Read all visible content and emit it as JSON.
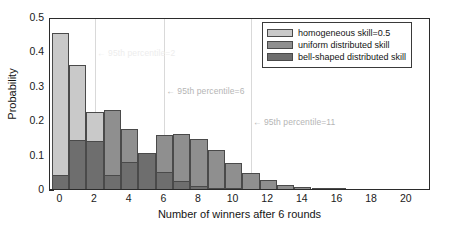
{
  "chart_data": {
    "type": "bar",
    "title": "",
    "subtitle": "",
    "xlabel": "Number of winners after 6 rounds",
    "ylabel": "Probability",
    "xlim": [
      -0.6,
      21.4
    ],
    "ylim": [
      0,
      0.5
    ],
    "xticks": [
      0,
      2,
      4,
      6,
      8,
      10,
      12,
      14,
      16,
      18,
      20
    ],
    "xtick_labels": [
      "0",
      "2",
      "4",
      "6",
      "8",
      "10",
      "12",
      "14",
      "16",
      "18",
      "20"
    ],
    "yticks": [
      0,
      0.1,
      0.2,
      0.3,
      0.4,
      0.5
    ],
    "ytick_labels": [
      "0",
      "0.1",
      "0.2",
      "0.3",
      "0.4",
      "0.5"
    ],
    "grid": false,
    "legend_position": "upper right",
    "bar_style": "overlaid",
    "categories": [
      0,
      1,
      2,
      3,
      4,
      5,
      6,
      7,
      8,
      9,
      10,
      11,
      12,
      13,
      14,
      15,
      16,
      17,
      18,
      19,
      20,
      21
    ],
    "series": [
      {
        "name": "homogeneous skill=0.5",
        "color": "#c9c9c9",
        "values": [
          0.453,
          0.36,
          0.225,
          0.0,
          0.0,
          0.0,
          0.0,
          0.0,
          0.0,
          0.0,
          0.0,
          0.0,
          0.0,
          0.0,
          0.0,
          0.0,
          0.0,
          0.0,
          0.0,
          0.0,
          0.0,
          0.0
        ]
      },
      {
        "name": "uniform distributed skill",
        "color": "#8f8f8f",
        "values": [
          0.042,
          0.004,
          0.013,
          0.231,
          0.175,
          0.104,
          0.156,
          0.161,
          0.144,
          0.113,
          0.077,
          0.048,
          0.027,
          0.013,
          0.005,
          0.002,
          0.001,
          0.0,
          0.0,
          0.0,
          0.0,
          0.0
        ]
      },
      {
        "name": "bell-shaped distributed skill",
        "color": "#6e6e6e",
        "values": [
          0.042,
          0.143,
          0.141,
          0.04,
          0.078,
          0.104,
          0.049,
          0.022,
          0.008,
          0.003,
          0.001,
          0.0,
          0.0,
          0.0,
          0.0,
          0.0,
          0.0,
          0.0,
          0.0,
          0.0,
          0.0,
          0.0
        ]
      }
    ],
    "annotations": [
      {
        "text": "← 95th percentile=2",
        "x": 2,
        "y": 0.415,
        "style": "faint"
      },
      {
        "text": "← 95th percentile=6",
        "x": 6,
        "y": 0.305,
        "style": "mid"
      },
      {
        "text": "← 95th percentile=11",
        "x": 11,
        "y": 0.215,
        "style": "mid"
      }
    ],
    "percentile_lines": [
      {
        "x": 2,
        "label": "95th percentile=2"
      },
      {
        "x": 6,
        "label": "95th percentile=6"
      },
      {
        "x": 11,
        "label": "95th percentile=11"
      }
    ]
  },
  "legend": {
    "items": [
      {
        "label": "homogeneous skill=0.5",
        "color": "#c9c9c9"
      },
      {
        "label": "uniform distributed skill",
        "color": "#8f8f8f"
      },
      {
        "label": "bell-shaped distributed skill",
        "color": "#6e6e6e"
      }
    ]
  }
}
